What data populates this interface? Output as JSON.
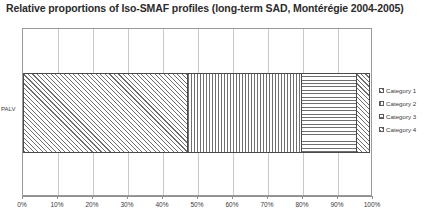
{
  "chart_data": {
    "type": "bar",
    "orientation": "horizontal",
    "stacked": true,
    "normalized_percent": true,
    "title": "Relative proportions of Iso-SMAF profiles (long-term SAD, Montérégie 2004-2005)",
    "xlabel": "",
    "ylabel": "",
    "categories": [
      "PALV"
    ],
    "xlim": [
      0,
      100
    ],
    "grid": true,
    "legend_position": "right",
    "x_tick_labels": [
      "0%",
      "10%",
      "20%",
      "30%",
      "40%",
      "50%",
      "60%",
      "70%",
      "80%",
      "90%",
      "100%"
    ],
    "x_tick_values": [
      0,
      10,
      20,
      30,
      40,
      50,
      60,
      70,
      80,
      90,
      100
    ],
    "y_tick_labels": [
      "PALV"
    ],
    "series": [
      {
        "name": "Category 1",
        "values": [
          47
        ],
        "pattern": "diagonal-up-hatch"
      },
      {
        "name": "Category 2",
        "values": [
          33
        ],
        "pattern": "vertical-lines"
      },
      {
        "name": "Category 3",
        "values": [
          16
        ],
        "pattern": "horizontal-lines"
      },
      {
        "name": "Category 4",
        "values": [
          4
        ],
        "pattern": "diagonal-up-hatch"
      }
    ],
    "colors": {
      "pattern_stroke": "#6e6e6e",
      "segment_border": "#4a4a4a",
      "gridline": "#c9c9c9",
      "axis": "#8f8f8f",
      "text": "#3a3a3a",
      "title_text": "#2b2b2b"
    }
  },
  "legend": {
    "items": [
      {
        "label": "Category 1"
      },
      {
        "label": "Category 2"
      },
      {
        "label": "Category 3"
      },
      {
        "label": "Category 4"
      }
    ]
  }
}
